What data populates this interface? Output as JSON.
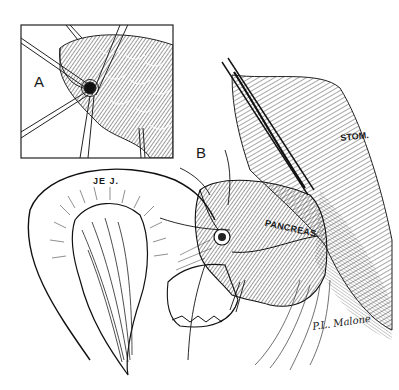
{
  "figure": {
    "panels": [
      {
        "id": "A",
        "label": "A"
      },
      {
        "id": "B",
        "label": "B"
      }
    ],
    "anatomy_labels": {
      "jejunum": "JE J.",
      "pancreas": "PANCREAS",
      "stomach": "STOM."
    },
    "signature": "P.L. Malone",
    "colors": {
      "ink": "#1a1a1a",
      "background": "#ffffff"
    }
  }
}
